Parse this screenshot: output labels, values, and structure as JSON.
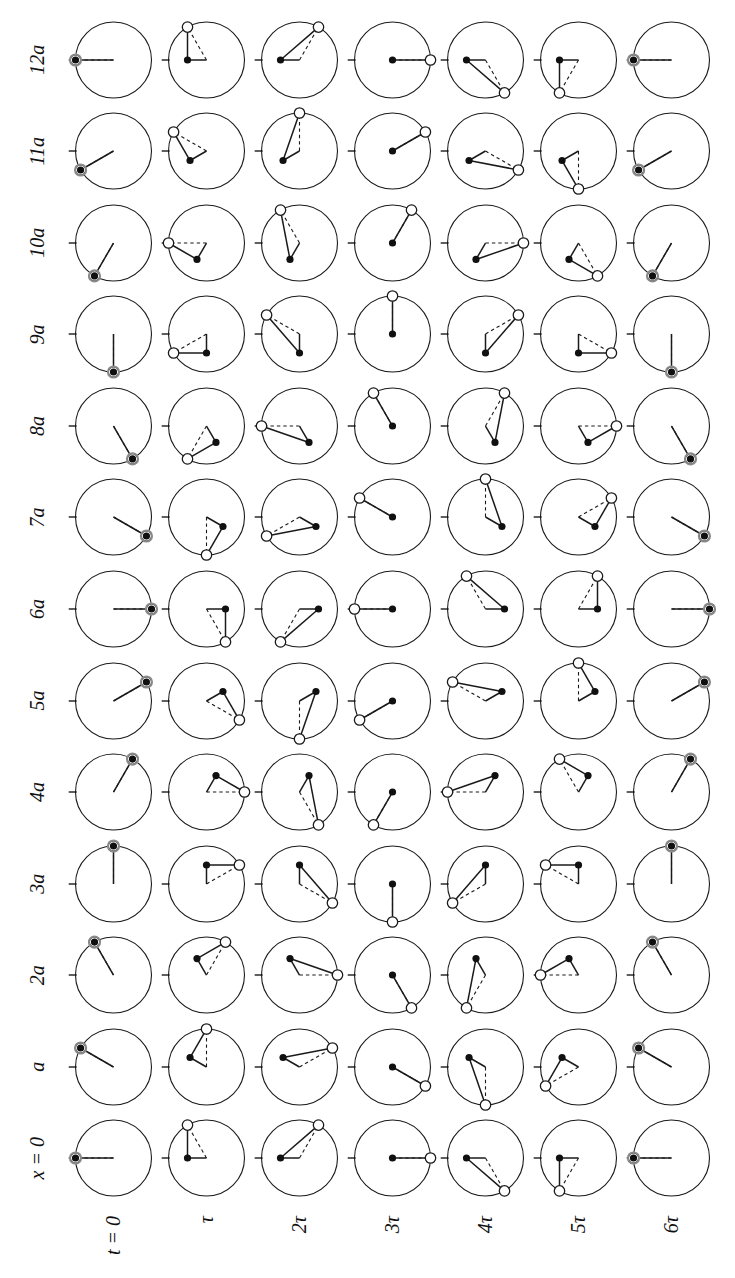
{
  "figure": {
    "kind": "phasor-grid",
    "caption_top": "",
    "axis_x_label": "x = 0",
    "axis_t_label": "t = 0",
    "n_cols": 13,
    "n_rows": 7,
    "cell_px": 96,
    "radius_px": 38,
    "arm_radius_px": 19,
    "tick_len_px": 8,
    "hollow_r_px": 5.2,
    "dot_r_px": 3.6,
    "colors": {
      "stroke": "#1a1a1a",
      "dot_fill": "#101010",
      "hollow_fill": "#ffffff",
      "coincide_ring": "#8a8a8a",
      "background": "#ffffff"
    },
    "col_labels": [
      "x = 0",
      "a",
      "2a",
      "3a",
      "4a",
      "5a",
      "6a",
      "7a",
      "8a",
      "9a",
      "10a",
      "11a",
      "12a"
    ],
    "row_labels": [
      "t = 0",
      "τ",
      "2τ",
      "3τ",
      "4τ",
      "5τ",
      "6τ"
    ],
    "phase_per_column_deg": 30,
    "phase_per_row_deg": 60,
    "note": "Each cell: dashed radius from centre to the open circle; solid segment centre-to-dot and dot-to-open-circle. Tick marks the 12-o'clock reference."
  },
  "chart_data": {
    "type": "scatter",
    "title": "",
    "xlabel": "x",
    "ylabel": "t",
    "grid": false,
    "legend": "none",
    "categories_x": [
      "x = 0",
      "a",
      "2a",
      "3a",
      "4a",
      "5a",
      "6a",
      "7a",
      "8a",
      "9a",
      "10a",
      "11a",
      "12a"
    ],
    "categories_y": [
      "t = 0",
      "τ",
      "2τ",
      "3τ",
      "4τ",
      "5τ",
      "6τ"
    ],
    "series": [
      {
        "name": "open-circle phase (deg, clockwise from top)",
        "per_column_step": 30,
        "per_row_step": 60
      },
      {
        "name": "dot phase (deg, clockwise from top)",
        "per_column_step": 30,
        "per_row_step": 0
      }
    ],
    "cells": [
      {
        "row": 0,
        "col": 0,
        "open_deg": 0,
        "dot_deg": 0,
        "dot_r": 0
      },
      {
        "row": 0,
        "col": 1,
        "open_deg": 30,
        "dot_deg": 30,
        "dot_r": 19
      },
      {
        "row": 0,
        "col": 2,
        "open_deg": 60,
        "dot_deg": 60,
        "dot_r": 19
      },
      {
        "row": 0,
        "col": 3,
        "open_deg": 90,
        "dot_deg": 90,
        "dot_r": 38
      },
      {
        "row": 0,
        "col": 4,
        "open_deg": 120,
        "dot_deg": 120,
        "dot_r": 19
      },
      {
        "row": 0,
        "col": 5,
        "open_deg": 150,
        "dot_deg": 150,
        "dot_r": 19
      },
      {
        "row": 0,
        "col": 6,
        "open_deg": 180,
        "dot_deg": 180,
        "dot_r": 0
      },
      {
        "row": 0,
        "col": 7,
        "open_deg": 210,
        "dot_deg": 210,
        "dot_r": 19
      },
      {
        "row": 0,
        "col": 8,
        "open_deg": 240,
        "dot_deg": 240,
        "dot_r": 19
      },
      {
        "row": 0,
        "col": 9,
        "open_deg": 270,
        "dot_deg": 270,
        "dot_r": 38
      },
      {
        "row": 0,
        "col": 10,
        "open_deg": 300,
        "dot_deg": 300,
        "dot_r": 19
      },
      {
        "row": 0,
        "col": 11,
        "open_deg": 330,
        "dot_deg": 330,
        "dot_r": 19
      },
      {
        "row": 0,
        "col": 12,
        "open_deg": 360,
        "dot_deg": 360,
        "dot_r": 0
      }
    ]
  }
}
